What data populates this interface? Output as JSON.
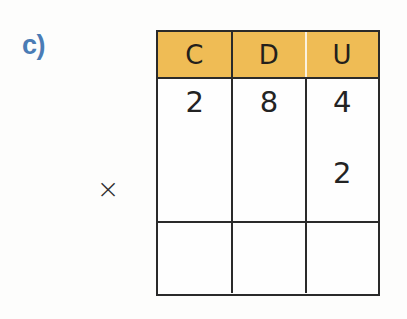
{
  "worksheet": {
    "exercise_label": "c)",
    "exercise_label_color": "#4a7cb5",
    "operator": "×",
    "operator_name": "multiplication-sign",
    "background_color": "#fdfdfc"
  },
  "table": {
    "header_background": "#efbc55",
    "border_color": "#2a2a2a",
    "columns": [
      {
        "key": "hundreds",
        "label": "C"
      },
      {
        "key": "tens",
        "label": "D"
      },
      {
        "key": "units",
        "label": "U"
      }
    ],
    "rows": [
      {
        "name": "multiplicand",
        "cells": [
          {
            "column": "hundreds",
            "value": "2"
          },
          {
            "column": "tens",
            "value": "8"
          },
          {
            "column": "units",
            "value": "4"
          }
        ]
      },
      {
        "name": "multiplier",
        "cells": [
          {
            "column": "hundreds",
            "value": ""
          },
          {
            "column": "tens",
            "value": ""
          },
          {
            "column": "units",
            "value": "2"
          }
        ]
      },
      {
        "name": "product",
        "cells": [
          {
            "column": "hundreds",
            "value": ""
          },
          {
            "column": "tens",
            "value": ""
          },
          {
            "column": "units",
            "value": ""
          }
        ]
      }
    ]
  }
}
